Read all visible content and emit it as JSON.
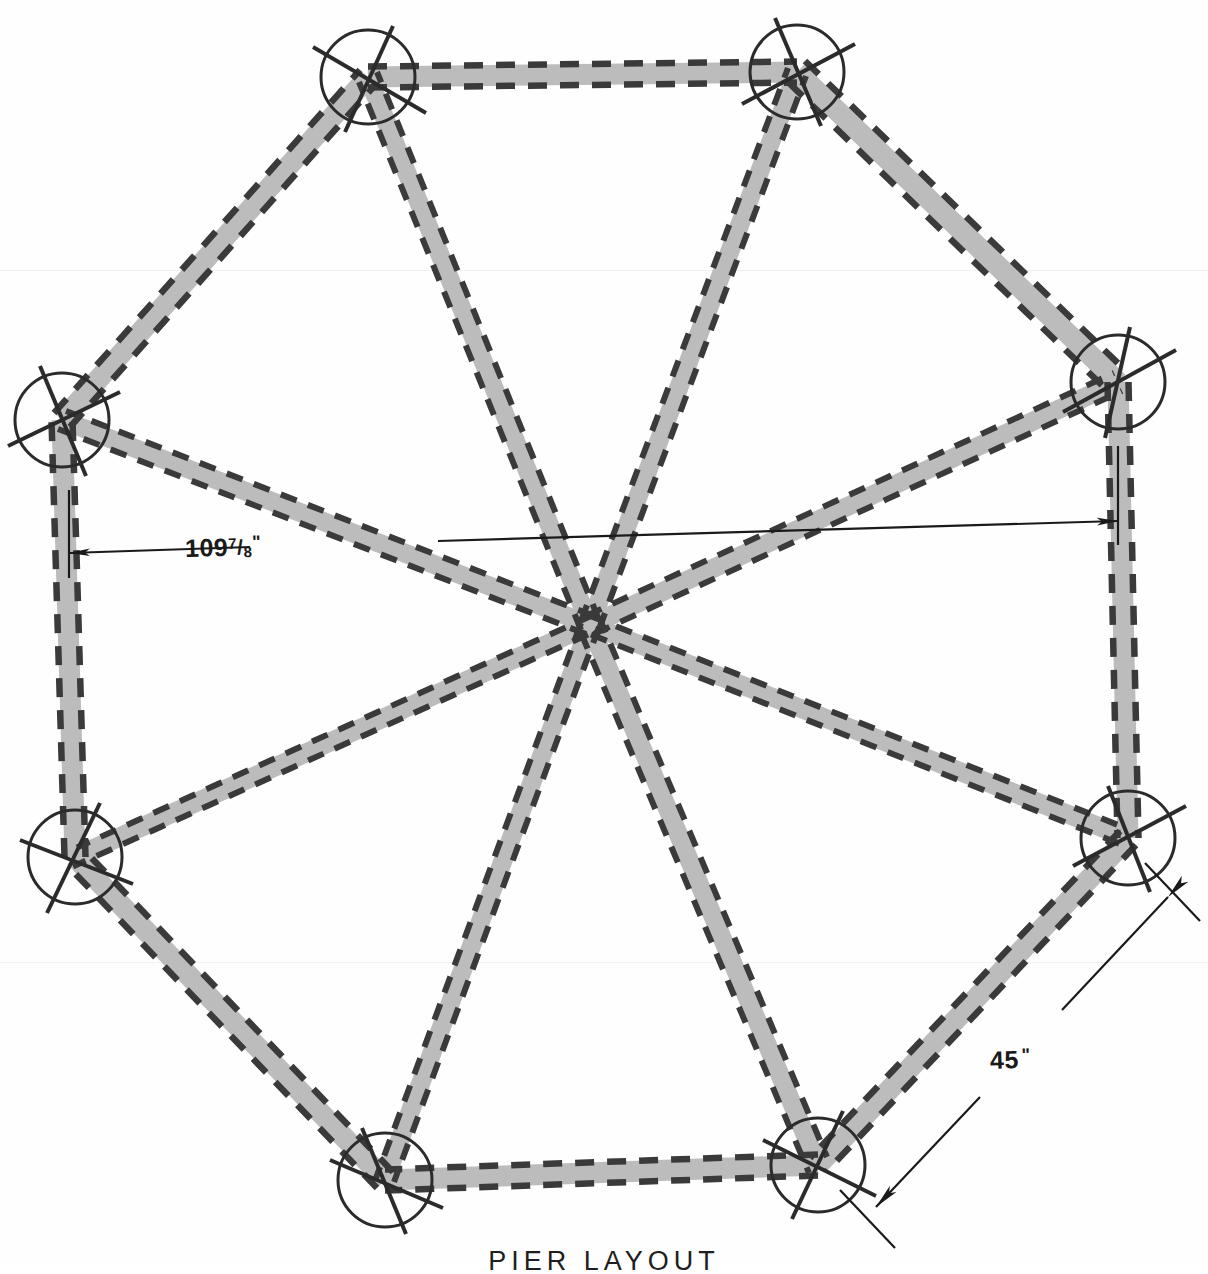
{
  "drawing": {
    "title": "PIER LAYOUT",
    "sheet_background": "#fefefe",
    "ink_color": "#2f2f2f",
    "beam_fill_color": "#bcbcbc",
    "dimension_line_color": "#1a1a1a",
    "shape": "octagon",
    "pier_count": 8,
    "radial_beam_count": 8,
    "perimeter_beam_count": 8
  },
  "dimensions": [
    {
      "id": "across-flats",
      "value": "109",
      "fraction_numerator": "7",
      "fraction_denominator": "8",
      "unit_mark": "\"",
      "full_text": "109 7/8\"",
      "description": "overall octagon width across opposite piers"
    },
    {
      "id": "side-length",
      "value": "45",
      "unit_mark": "\"",
      "full_text": "45\"",
      "description": "length of one octagon side beam"
    }
  ],
  "piers": [
    {
      "id": "pier-top-left",
      "label": "top-left pier",
      "cx": 368,
      "cy": 77,
      "r": 47
    },
    {
      "id": "pier-top-right",
      "label": "top-right pier",
      "cx": 797,
      "cy": 72,
      "r": 47
    },
    {
      "id": "pier-right-upper",
      "label": "right-upper pier",
      "cx": 1118,
      "cy": 382,
      "r": 47
    },
    {
      "id": "pier-right-lower",
      "label": "right-lower pier",
      "cx": 1128,
      "cy": 838,
      "r": 47
    },
    {
      "id": "pier-bottom-right",
      "label": "bottom-right pier",
      "cx": 818,
      "cy": 1165,
      "r": 47
    },
    {
      "id": "pier-bottom-left",
      "label": "bottom-left pier",
      "cx": 385,
      "cy": 1180,
      "r": 47
    },
    {
      "id": "pier-left-lower",
      "label": "left-lower pier",
      "cx": 75,
      "cy": 857,
      "r": 47
    },
    {
      "id": "pier-left-upper",
      "label": "left-upper pier",
      "cx": 62,
      "cy": 420,
      "r": 47
    }
  ],
  "center_hub": {
    "id": "center-hub",
    "cx": 590,
    "cy": 625
  }
}
